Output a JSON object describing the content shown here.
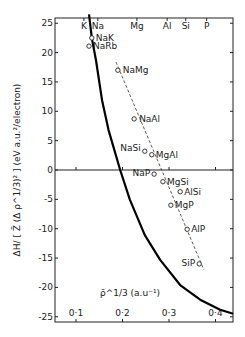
{
  "chart_data": {
    "type": "scatter",
    "title": "",
    "xlabel": "ρ̄^1/3 (a.u.^-1)",
    "ylabel": "ΔH / [ Z̄ (Δ ρ^1/3)^2 ]  (eV a.u.^2/electron)",
    "xlim": [
      0.055,
      0.438
    ],
    "ylim": [
      -26,
      26.5
    ],
    "x_ticks": [
      0.1,
      0.2,
      0.3,
      0.4
    ],
    "x_tick_labels": [
      "0·1",
      "0·2",
      "0·3",
      "0·4"
    ],
    "y_ticks": [
      25,
      20,
      15,
      10,
      5,
      0,
      -5,
      -10,
      -15,
      -20,
      -25
    ],
    "y_tick_labels": [
      "25",
      "20",
      "15",
      "10",
      "5",
      "0",
      "-5",
      "-10",
      "-15",
      "-20",
      "-25"
    ],
    "top_axis_labels": [
      {
        "label": "K",
        "x": 0.117
      },
      {
        "label": "Na",
        "x": 0.147
      },
      {
        "label": "Mg",
        "x": 0.231
      },
      {
        "label": "Al",
        "x": 0.296
      },
      {
        "label": "Si",
        "x": 0.336
      },
      {
        "label": "P",
        "x": 0.381
      }
    ],
    "grid": false,
    "zero_line": true,
    "points": [
      {
        "label": "NaK",
        "x": 0.134,
        "y": 22.5
      },
      {
        "label": "NaRb",
        "x": 0.128,
        "y": 21.1
      },
      {
        "label": "NaMg",
        "x": 0.19,
        "y": 17.0
      },
      {
        "label": "NaAl",
        "x": 0.225,
        "y": 8.7
      },
      {
        "label": "NaSi",
        "x": 0.248,
        "y": 3.2
      },
      {
        "label": "MgAl",
        "x": 0.263,
        "y": 2.6
      },
      {
        "label": "NaP",
        "x": 0.268,
        "y": -0.7
      },
      {
        "label": "MgSi",
        "x": 0.287,
        "y": -2.0
      },
      {
        "label": "AlSi",
        "x": 0.324,
        "y": -3.7
      },
      {
        "label": "MgP",
        "x": 0.304,
        "y": -6.0
      },
      {
        "label": "AlP",
        "x": 0.339,
        "y": -10.1
      },
      {
        "label": "SiP",
        "x": 0.365,
        "y": -16.0
      }
    ],
    "series": [
      {
        "name": "universal curve (solid)",
        "style": "solid-thick",
        "x": [
          0.128,
          0.134,
          0.143,
          0.156,
          0.17,
          0.195,
          0.216,
          0.248,
          0.281,
          0.324,
          0.367,
          0.41,
          0.438
        ],
        "y": [
          26.5,
          22.5,
          18.7,
          11.9,
          6.8,
          0.0,
          -5.1,
          -11.1,
          -15.3,
          -19.6,
          -22.1,
          -23.8,
          -24.5
        ]
      },
      {
        "name": "linear fit (dashed)",
        "style": "dashed",
        "x": [
          0.186,
          0.375
        ],
        "y": [
          18.4,
          -17.0
        ]
      }
    ]
  },
  "labels": {
    "y_axis_title": "ΔH/ [ Z̄ (Δ ρ^1/3)² ]  (eV a.u.²/electron)",
    "x_axis_title": "ρ̄^1/3 (a.u⁻¹)"
  }
}
